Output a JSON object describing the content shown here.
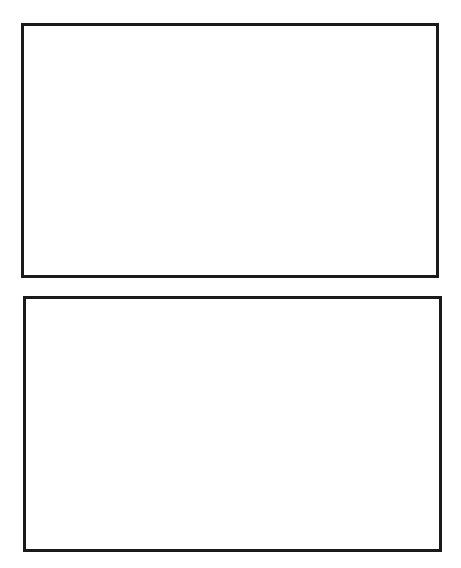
{
  "figure": {
    "panels": [
      {
        "id": "top",
        "description": "Normal ECG rhythm with stable baseline",
        "wave_labels": [
          "P",
          "Q",
          "R",
          "S",
          "T",
          "U"
        ],
        "beats": 7,
        "baseline": "stable"
      },
      {
        "id": "bottom",
        "description": "ECG rhythm with baseline wander / drift",
        "beats": 7,
        "baseline": "wandering"
      }
    ],
    "labels": {
      "P": "P",
      "Q": "Q",
      "R": "R",
      "S": "S",
      "T": "T",
      "U": "U"
    },
    "colors": {
      "trace": "#1a1a1a",
      "frame": "#1a1a1a",
      "background": "#ffffff"
    }
  }
}
